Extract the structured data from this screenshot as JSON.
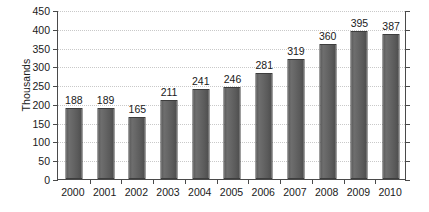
{
  "chart_data": {
    "type": "bar",
    "title": "",
    "subtitle": "",
    "xlabel": "",
    "ylabel": "Thousands",
    "categories": [
      "2000",
      "2001",
      "2002",
      "2003",
      "2004",
      "2005",
      "2006",
      "2007",
      "2008",
      "2009",
      "2010"
    ],
    "values": [
      188,
      189,
      165,
      211,
      241,
      246,
      281,
      319,
      360,
      395,
      387
    ],
    "data_labels": [
      "188",
      "189",
      "165",
      "211",
      "241",
      "246",
      "281",
      "319",
      "360",
      "395",
      "387"
    ],
    "ylim": [
      0,
      450
    ],
    "ytick_step": 50,
    "ytick_labels": [
      "0",
      "50",
      "100",
      "150",
      "200",
      "250",
      "300",
      "350",
      "400",
      "450"
    ],
    "ytick_values": [
      0,
      50,
      100,
      150,
      200,
      250,
      300,
      350,
      400,
      450
    ],
    "grid": "horizontal-dotted",
    "legend": "none",
    "series": [
      {
        "name": "",
        "values": [
          188,
          189,
          165,
          211,
          241,
          246,
          281,
          319,
          360,
          395,
          387
        ],
        "color": "#5f5f5f"
      }
    ],
    "colors": {
      "bar_fill": "#5f5f5f",
      "bar_edge": "#3d3d3d",
      "gridline": "#c9c9c9",
      "axis": "#4a4a4a",
      "text": "#1a1a1a",
      "background": "#ffffff"
    }
  }
}
